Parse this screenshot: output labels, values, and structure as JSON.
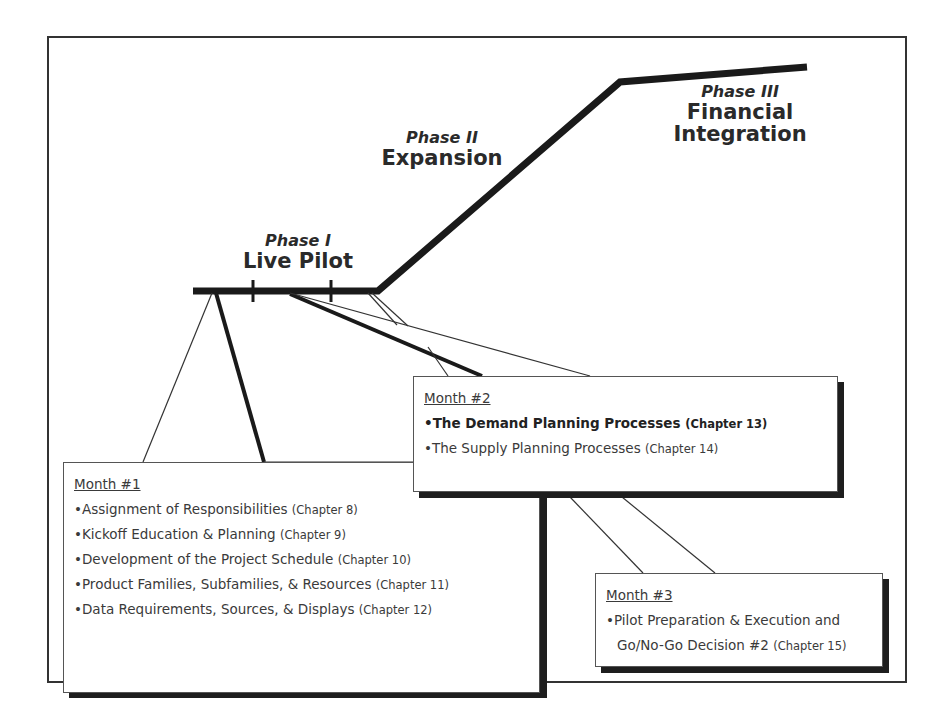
{
  "diagram": {
    "phases": [
      {
        "phase": "Phase I",
        "name": "Live Pilot"
      },
      {
        "phase": "Phase II",
        "name": "Expansion"
      },
      {
        "phase": "Phase III",
        "name_line1": "Financial",
        "name_line2": "Integration"
      }
    ],
    "months": [
      {
        "title": "Month #1",
        "items": [
          {
            "bullet": "•",
            "text": "Assignment of Responsibilities",
            "chapter": "(Chapter 8)"
          },
          {
            "bullet": "•",
            "text": "Kickoff Education & Planning",
            "chapter": "(Chapter 9)"
          },
          {
            "bullet": "•",
            "text": "Development of the Project Schedule",
            "chapter": "(Chapter 10)"
          },
          {
            "bullet": "•",
            "text": "Product Families, Subfamilies, & Resources",
            "chapter": "(Chapter 11)"
          },
          {
            "bullet": "•",
            "text": "Data Requirements, Sources, & Displays",
            "chapter": "(Chapter 12)"
          }
        ]
      },
      {
        "title": "Month #2",
        "items": [
          {
            "bullet": "•",
            "text": "The Demand Planning Processes",
            "chapter": "(Chapter 13)",
            "emphasis": "bold"
          },
          {
            "bullet": "•",
            "text": "The Supply Planning Processes",
            "chapter": "(Chapter 14)"
          }
        ]
      },
      {
        "title": "Month #3",
        "items": [
          {
            "bullet": "•",
            "text": "Pilot Preparation & Execution and"
          },
          {
            "bullet": "",
            "text": "Go/No-Go Decision #2",
            "chapter": "(Chapter 15)"
          }
        ]
      }
    ],
    "colors": {
      "line": "#1a1a1a",
      "frame": "#333333",
      "text": "#2a2a2a",
      "background": "#ffffff"
    }
  }
}
